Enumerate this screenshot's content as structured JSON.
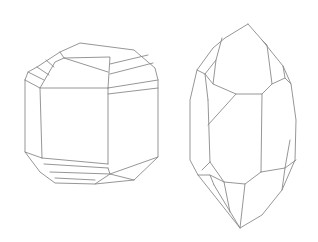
{
  "figure": {
    "stroke_color": "#8a8a8a",
    "background": "#ffffff",
    "crystals": [
      {
        "name": "stubby-crystal",
        "position": "left"
      },
      {
        "name": "elongated-crystal",
        "position": "right"
      }
    ]
  }
}
